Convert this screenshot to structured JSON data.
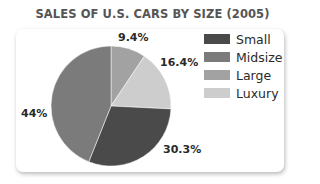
{
  "chart_data": {
    "type": "pie",
    "title": "SALES OF U.S. CARS BY SIZE (2005)",
    "categories": [
      "Small",
      "Midsize",
      "Large",
      "Luxury"
    ],
    "values": [
      30.3,
      44,
      9.4,
      16.4
    ],
    "value_labels": [
      "30.3%",
      "44%",
      "9.4%",
      "16.4%"
    ],
    "colors": [
      "#4a4a4a",
      "#7b7b7b",
      "#a2a2a2",
      "#cdcdcd"
    ],
    "legend_position": "right",
    "slice_order_clockwise_from_top": [
      "Large",
      "Luxury",
      "Small",
      "Midsize"
    ]
  },
  "title": "SALES OF U.S. CARS BY SIZE (2005)",
  "legend": [
    {
      "label": "Small",
      "color": "#4a4a4a"
    },
    {
      "label": "Midsize",
      "color": "#7b7b7b"
    },
    {
      "label": "Large",
      "color": "#a2a2a2"
    },
    {
      "label": "Luxury",
      "color": "#cdcdcd"
    }
  ],
  "labels": {
    "large": "9.4%",
    "luxury": "16.4%",
    "small": "30.3%",
    "midsize": "44%"
  }
}
